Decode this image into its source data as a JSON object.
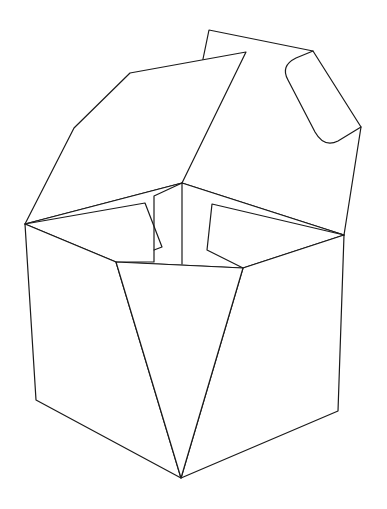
{
  "figure": {
    "title": "",
    "stroke_color": "#1a1a1a",
    "background_color": "#ffffff",
    "parts": [
      {
        "name": "back-flap-with-handle-slot"
      },
      {
        "name": "left-top-flap"
      },
      {
        "name": "inner-left-flap"
      },
      {
        "name": "inner-right-flap"
      },
      {
        "name": "left-side-panel"
      },
      {
        "name": "right-side-panel"
      },
      {
        "name": "front-triangular-panel"
      }
    ]
  }
}
